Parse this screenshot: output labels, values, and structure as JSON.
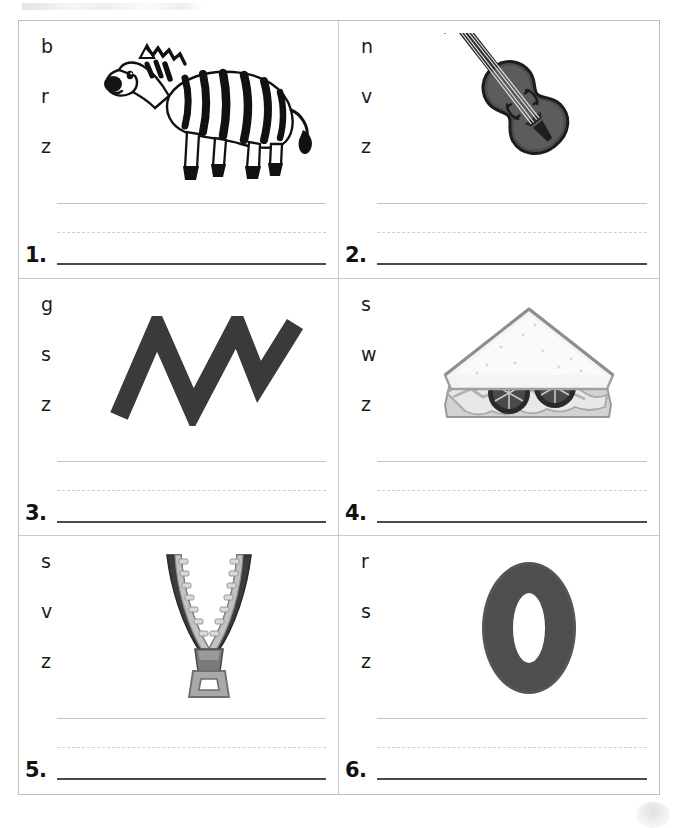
{
  "page": {
    "kind": "phonics-worksheet",
    "grid_columns": 2,
    "grid_rows": 3,
    "border_color": "#bdbdbd",
    "line_base_color": "#4a4a4a",
    "line_guide_color": "#c4c4c4"
  },
  "items": [
    {
      "number": "1.",
      "choices": [
        "b",
        "r",
        "z"
      ],
      "picture": "zebra-image",
      "picture_label": "zebra"
    },
    {
      "number": "2.",
      "choices": [
        "n",
        "v",
        "z"
      ],
      "picture": "violin-image",
      "picture_label": "violin"
    },
    {
      "number": "3.",
      "choices": [
        "g",
        "s",
        "z"
      ],
      "picture": "zigzag-image",
      "picture_label": "zigzag"
    },
    {
      "number": "4.",
      "choices": [
        "s",
        "w",
        "z"
      ],
      "picture": "sandwich-image",
      "picture_label": "sandwich"
    },
    {
      "number": "5.",
      "choices": [
        "s",
        "v",
        "z"
      ],
      "picture": "zipper-image",
      "picture_label": "zipper"
    },
    {
      "number": "6.",
      "choices": [
        "r",
        "s",
        "z"
      ],
      "picture": "zero-image",
      "picture_label": "zero"
    }
  ]
}
